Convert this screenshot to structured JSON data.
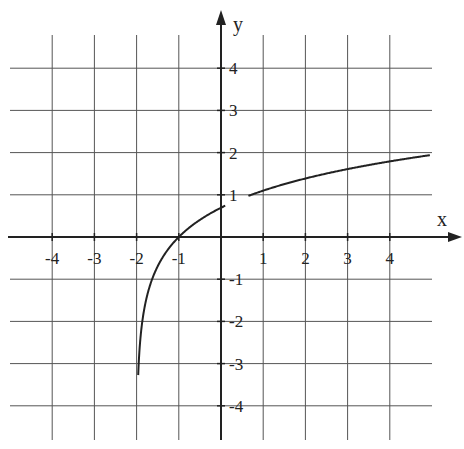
{
  "chart_data": {
    "type": "line",
    "title": "",
    "xlabel": "x",
    "ylabel": "y",
    "xlim": [
      -5,
      5
    ],
    "ylim": [
      -4.6,
      5
    ],
    "grid": true,
    "x_ticks": [
      -4,
      -3,
      -2,
      -1,
      1,
      2,
      3,
      4
    ],
    "y_ticks": [
      4,
      3,
      2,
      1,
      -1,
      -2,
      -3,
      -4
    ],
    "x_tick_labels": [
      "-4",
      "-3",
      "-2",
      "-1",
      "1",
      "2",
      "3",
      "4"
    ],
    "y_tick_labels": [
      "4",
      "3",
      "2",
      "1",
      "-1",
      "-2",
      "-3",
      "-4"
    ],
    "series": [
      {
        "name": "y = ln(x + 2)",
        "function": "ln(x+2)",
        "vertical_asymptote": -2,
        "x": [
          -1.96,
          -1.9,
          -1.8,
          -1.5,
          -1,
          0,
          1,
          2,
          3,
          4,
          4.9
        ],
        "values": [
          -3.91,
          -2.3,
          -1.61,
          -0.69,
          0,
          0.69,
          1.1,
          1.39,
          1.61,
          1.79,
          1.96
        ]
      }
    ]
  },
  "labels": {
    "x_axis": "x",
    "y_axis": "y"
  },
  "colors": {
    "grid": "#555555",
    "axis": "#222222",
    "curve": "#222222"
  }
}
